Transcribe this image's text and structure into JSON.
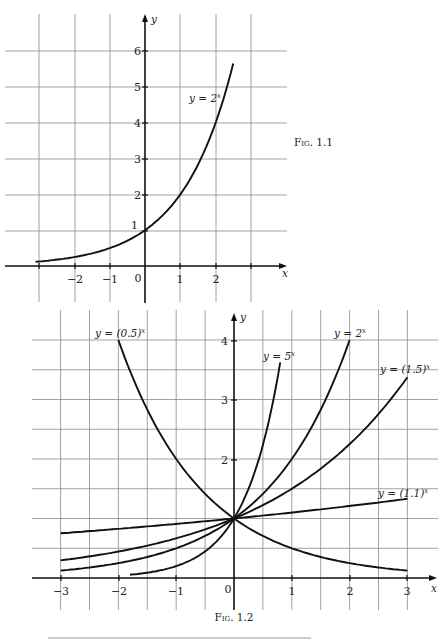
{
  "chart_data": [
    {
      "type": "line",
      "caption": "Fig. 1.1",
      "xlabel": "x",
      "ylabel": "y",
      "x_ticks": [
        "−2",
        "−1",
        "0",
        "1",
        "2"
      ],
      "y_ticks": [
        "1",
        "2",
        "3",
        "4",
        "5",
        "6"
      ],
      "xlim": [
        -3,
        3
      ],
      "ylim": [
        0,
        6
      ],
      "grid": true,
      "series": [
        {
          "name": "y = 2^x",
          "label": "y = 2",
          "sup": "x",
          "base": 2,
          "x_range": [
            -3.1,
            2.5
          ]
        }
      ]
    },
    {
      "type": "line",
      "caption": "Fig. 1.2",
      "xlabel": "x",
      "ylabel": "y",
      "x_ticks": [
        "−3",
        "−2",
        "−1",
        "0",
        "1",
        "2",
        "3"
      ],
      "y_ticks": [
        "2",
        "3",
        "4"
      ],
      "xlim": [
        -3,
        3
      ],
      "ylim": [
        0,
        4
      ],
      "grid": true,
      "grid_step": 0.5,
      "series": [
        {
          "name": "y = (0.5)^x",
          "label": "y = (0.5)",
          "sup": "x",
          "base": 0.5,
          "x_range": [
            -2,
            3
          ]
        },
        {
          "name": "y = 5^x",
          "label": "y = 5",
          "sup": "x",
          "base": 5,
          "x_range": [
            -1.8,
            0.8
          ]
        },
        {
          "name": "y = 2^x",
          "label": "y = 2",
          "sup": "x",
          "base": 2,
          "x_range": [
            -3,
            2
          ]
        },
        {
          "name": "y = (1.5)^x",
          "label": "y = (1.5)",
          "sup": "x",
          "base": 1.5,
          "x_range": [
            -3,
            3
          ]
        },
        {
          "name": "y = (1.1)^x",
          "label": "y = (1.1)",
          "sup": "x",
          "base": 1.1,
          "x_range": [
            -3,
            3
          ]
        }
      ]
    }
  ]
}
